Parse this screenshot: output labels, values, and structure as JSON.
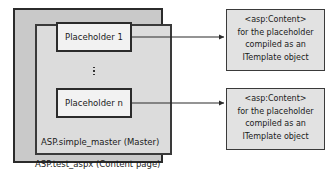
{
  "diagram": {
    "colors": {
      "content_page_fill": "#c9c9c9",
      "master_page_fill": "#dcdcdc",
      "placeholder_fill": "#f2f2f2",
      "callout_fill": "#e2e2e2",
      "border": "#2b2b2b",
      "arrow": "#2b2b2b",
      "text": "#1a1a1a",
      "page_background": "#ffffff"
    },
    "content_page": {
      "caption": "ASP.test_aspx (Content page)"
    },
    "master_page": {
      "caption": "ASP.simple_master (Master)"
    },
    "placeholders": [
      {
        "label": "Placeholder 1"
      },
      {
        "label": "Placeholder n"
      }
    ],
    "ellipsis": {
      "glyph": "vertical-ellipsis",
      "dot_count": 3
    },
    "callouts": [
      {
        "lines": [
          "<asp:Content>",
          "for the placeholder",
          "compiled as an",
          "ITemplate object"
        ]
      },
      {
        "lines": [
          "<asp:Content>",
          "for the placeholder",
          "compiled as an",
          "ITemplate object"
        ]
      }
    ],
    "connectors": [
      {
        "name": "arrow-placeholder-1-to-callout-1",
        "from": "Placeholder 1",
        "to": "callout-1",
        "style": "solid-arrow"
      },
      {
        "name": "arrow-placeholder-n-to-callout-2",
        "from": "Placeholder n",
        "to": "callout-2",
        "style": "solid-arrow"
      }
    ]
  }
}
